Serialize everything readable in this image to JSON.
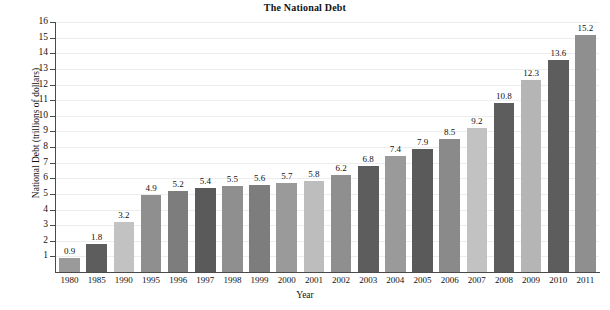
{
  "chart_data": {
    "type": "bar",
    "title": "The National Debt",
    "xlabel": "Year",
    "ylabel": "National Debt (trillions of dollars)",
    "ylim": [
      0,
      16
    ],
    "ytick_labels": [
      "16",
      "15",
      "14",
      "13",
      "12",
      "11",
      "10",
      "9",
      "8",
      "7",
      "6",
      "5",
      "4",
      "3",
      "2",
      "1"
    ],
    "yticks": [
      16,
      15,
      14,
      13,
      12,
      11,
      10,
      9,
      8,
      7,
      6,
      5,
      4,
      3,
      2,
      1
    ],
    "grid": true,
    "legend": "none",
    "categories": [
      "1980",
      "1985",
      "1990",
      "1995",
      "1996",
      "1997",
      "1998",
      "1999",
      "2000",
      "2001",
      "2002",
      "2003",
      "2004",
      "2005",
      "2006",
      "2007",
      "2008",
      "2009",
      "2010",
      "2011"
    ],
    "values": [
      0.9,
      1.8,
      3.2,
      4.9,
      5.2,
      5.4,
      5.5,
      5.6,
      5.7,
      5.8,
      6.2,
      6.8,
      7.4,
      7.9,
      8.5,
      9.2,
      10.8,
      12.3,
      13.6,
      15.2
    ],
    "value_labels": [
      "0.9",
      "1.8",
      "3.2",
      "4.9",
      "5.2",
      "5.4",
      "5.5",
      "5.6",
      "5.7",
      "5.8",
      "6.2",
      "6.8",
      "7.4",
      "7.9",
      "8.5",
      "9.2",
      "10.8",
      "12.3",
      "13.6",
      "15.2"
    ],
    "bar_colors": [
      "#9a9a9a",
      "#5d5d5d",
      "#c2c2c2",
      "#8f8f8f",
      "#7d7d7d",
      "#5a5a5a",
      "#8f8f8f",
      "#7d7d7d",
      "#9a9a9a",
      "#bdbdbd",
      "#8f8f8f",
      "#5d5d5d",
      "#9a9a9a",
      "#5a5a5a",
      "#8a8a8a",
      "#c2c2c2",
      "#5d5d5d",
      "#b5b5b5",
      "#5d5d5d",
      "#8f8f8f"
    ],
    "axis_color": "#4a4a4a",
    "gridline_color": "#ededed",
    "background": "#ffffff",
    "text_color": "#111111"
  }
}
